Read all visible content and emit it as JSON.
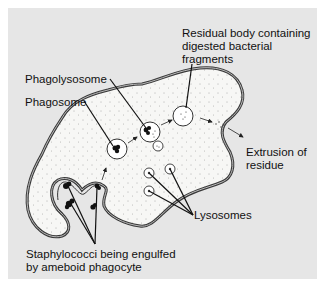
{
  "diagram": {
    "colors": {
      "panel_bg": "#e6e6e6",
      "cell_fill": "#f7f7f5",
      "membrane": "#3a3a3a",
      "text": "#111111"
    },
    "labels": {
      "residual_body_line1": "Residual body containing",
      "residual_body_line2": "digested bacterial",
      "residual_body_line3": "fragments",
      "phagolysosome": "Phagolysosome",
      "phagosome": "Phagosome",
      "extrusion_line1": "Extrusion of",
      "extrusion_line2": "residue",
      "lysosomes": "Lysosomes",
      "staph_line1": "Staphylococci being engulfed",
      "staph_line2": "by ameboid phagocyte"
    }
  }
}
